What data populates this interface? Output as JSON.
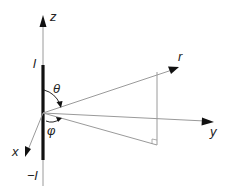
{
  "diagram": {
    "labels": {
      "z": "z",
      "y": "y",
      "x": "x",
      "r": "r",
      "theta": "θ",
      "phi": "φ",
      "top_l": "l",
      "bottom_l": "−l"
    },
    "colors": {
      "axis": "#9a9a9a",
      "rod": "#111111",
      "arrow": "#111111",
      "text": "#222222"
    }
  }
}
